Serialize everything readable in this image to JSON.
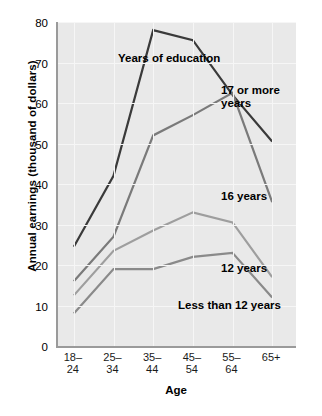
{
  "chart_data": {
    "type": "line",
    "title": "",
    "xlabel": "Age",
    "ylabel": "Annual earnings (thousand of dollars)",
    "categories": [
      "18-\n24",
      "25-\n34",
      "35-\n44",
      "45-\n54",
      "55-\n64",
      "65+"
    ],
    "category_labels_line1": [
      "18–",
      "25–",
      "35–",
      "45–",
      "55–",
      "65+"
    ],
    "category_labels_line2": [
      "24",
      "34",
      "44",
      "54",
      "64",
      ""
    ],
    "ylim": [
      0,
      80
    ],
    "yticks": [
      0,
      10,
      20,
      30,
      40,
      50,
      60,
      70,
      80
    ],
    "grid": true,
    "legend": "inline-annotations",
    "legend_position": "inside-plot",
    "series": [
      {
        "name": "17 or more years",
        "color": "#3a3a3a",
        "values": [
          24.5,
          42.0,
          78.0,
          75.5,
          62.0,
          50.5
        ]
      },
      {
        "name": "16 years",
        "color": "#7a7a7a",
        "values": [
          16.0,
          27.0,
          52.0,
          57.0,
          62.5,
          35.5
        ]
      },
      {
        "name": "12 years",
        "color": "#9e9e9e",
        "values": [
          12.5,
          23.5,
          28.5,
          33.0,
          30.5,
          17.0
        ]
      },
      {
        "name": "Less than 12 years",
        "color": "#8a8a8a",
        "values": [
          8.0,
          19.0,
          19.0,
          22.0,
          23.0,
          12.0
        ]
      }
    ],
    "annotations": [
      {
        "id": "years-of-education",
        "text": "Years of education"
      },
      {
        "id": "series-17-or-more",
        "text": "17 or more\nyears"
      },
      {
        "id": "series-16",
        "text": "16 years"
      },
      {
        "id": "series-12",
        "text": "12 years"
      },
      {
        "id": "series-less-than-12",
        "text": "Less than 12 years"
      }
    ],
    "colors": {
      "plot_background": "#e9e9e9",
      "grid": "#f6f6f6",
      "axis": "#9a9a9a",
      "text": "#000000"
    }
  }
}
